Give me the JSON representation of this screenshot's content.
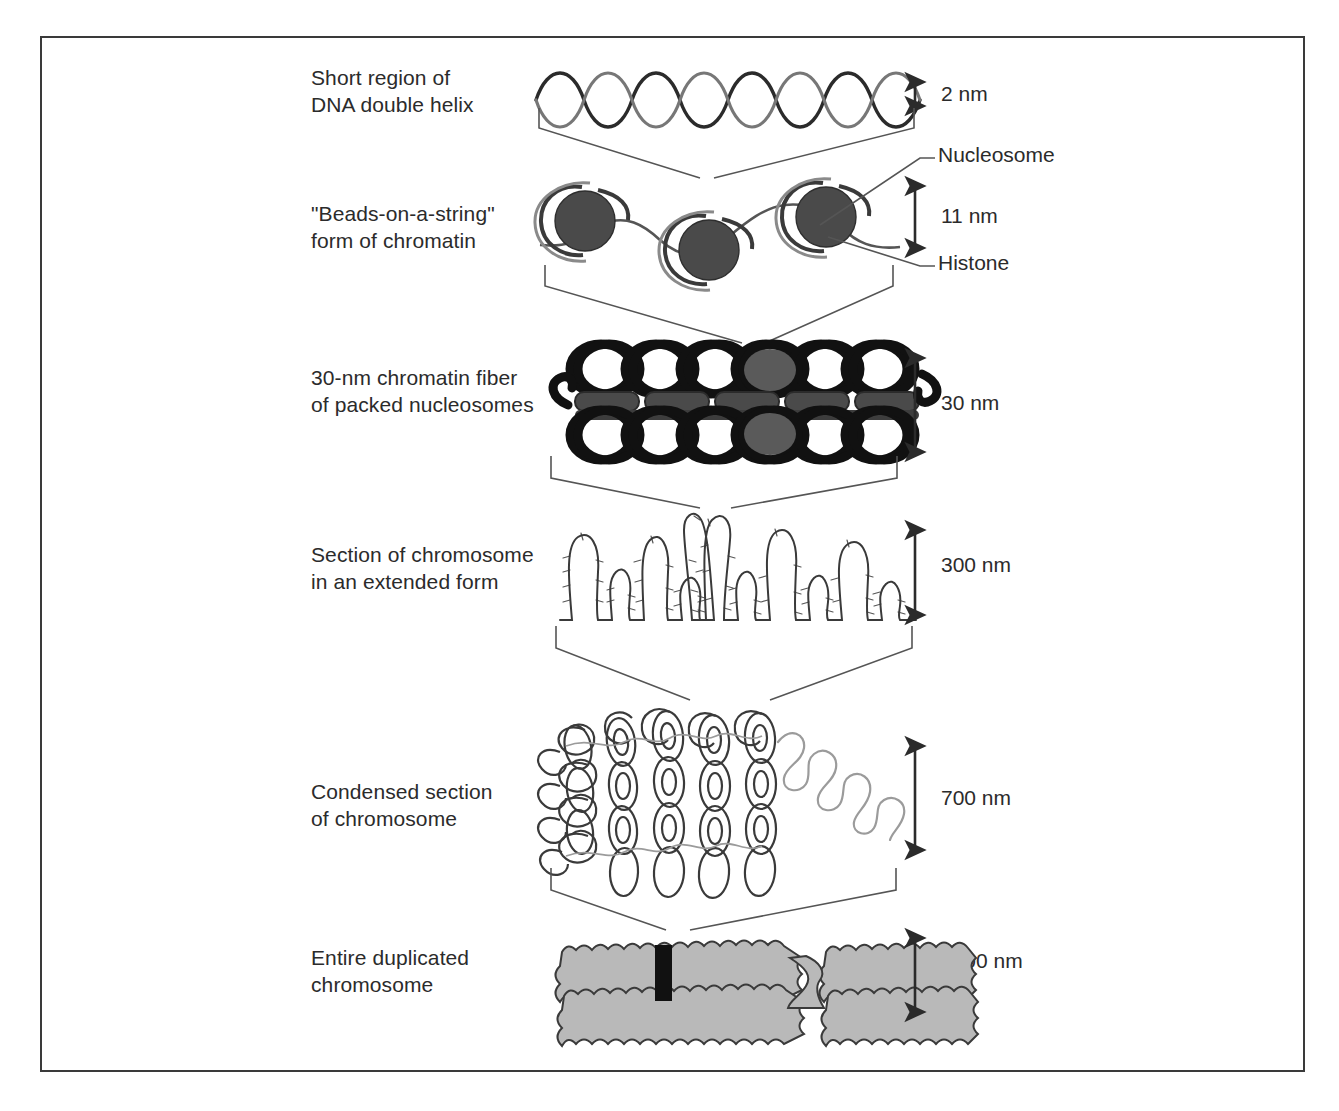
{
  "figure": {
    "border_color": "#3a3a3a",
    "background": "#ffffff",
    "ink_color": "#2b2b2b",
    "nucleosome_core_color": "#4a4a4a",
    "chromosome_fill_color": "#b3b3b3",
    "centromere_color": "#111111"
  },
  "levels": [
    {
      "id": "dna-double-helix",
      "label": "Short region of\nDNA double helix",
      "scale": "2 nm"
    },
    {
      "id": "beads-on-a-string",
      "label": "\"Beads-on-a-string\"\nform of chromatin",
      "scale": "11 nm"
    },
    {
      "id": "chromatin-fiber-30nm",
      "label": "30-nm chromatin fiber\nof packed nucleosomes",
      "scale": "30 nm"
    },
    {
      "id": "extended-chromosome-section",
      "label": "Section of chromosome\nin an extended form",
      "scale": "300 nm"
    },
    {
      "id": "condensed-chromosome-section",
      "label": "Condensed section\nof chromosome",
      "scale": "700 nm"
    },
    {
      "id": "duplicated-chromosome",
      "label": "Entire duplicated\nchromosome",
      "scale": "1400 nm"
    }
  ],
  "callouts": [
    {
      "id": "nucleosome",
      "label": "Nucleosome"
    },
    {
      "id": "histone",
      "label": "Histone"
    }
  ]
}
